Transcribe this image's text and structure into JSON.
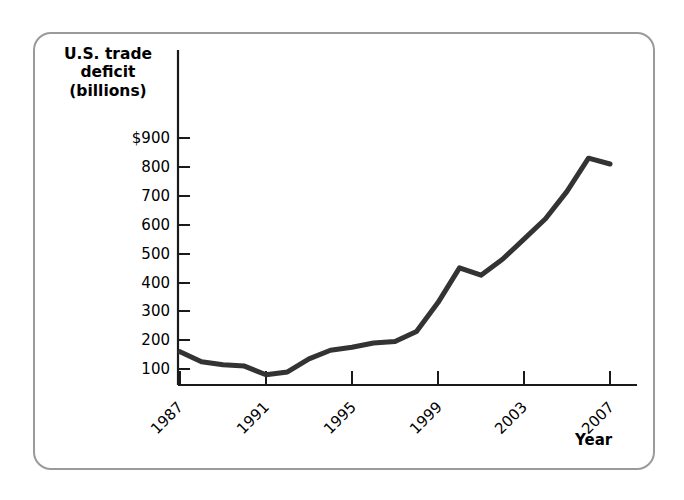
{
  "figure": {
    "frame_color": "#9a9a9a",
    "background": "#ffffff"
  },
  "axes": {
    "y_title_line1": "U.S. trade",
    "y_title_line2": "deficit",
    "y_title_line3": "(billions)",
    "x_title": "Year",
    "axis_color": "#1a1a1a"
  },
  "chart_data": {
    "type": "line",
    "title": "",
    "subtitle": "",
    "xlabel": "Year",
    "ylabel": "U.S. trade deficit (billions)",
    "line_color": "#333333",
    "line_width": 5,
    "grid": false,
    "legend": "none",
    "xlim": [
      1986,
      2008
    ],
    "ylim": [
      0,
      950
    ],
    "x_tick_labels": [
      "1987",
      "1991",
      "1995",
      "1999",
      "2003",
      "2007"
    ],
    "x_ticks": [
      1987,
      1991,
      1995,
      1999,
      2003,
      2007
    ],
    "y_tick_labels": [
      "$900",
      "800",
      "700",
      "600",
      "500",
      "400",
      "300",
      "200",
      "100"
    ],
    "y_ticks": [
      900,
      800,
      700,
      600,
      500,
      400,
      300,
      200,
      100
    ],
    "x": [
      1987,
      1988,
      1989,
      1990,
      1991,
      1992,
      1993,
      1994,
      1995,
      1996,
      1997,
      1998,
      1999,
      2000,
      2001,
      2002,
      2003,
      2004,
      2005,
      2006,
      2007
    ],
    "values": [
      160,
      125,
      115,
      110,
      80,
      90,
      135,
      165,
      175,
      190,
      195,
      230,
      330,
      450,
      425,
      480,
      550,
      620,
      715,
      830,
      810
    ],
    "series": [
      {
        "name": "U.S. trade deficit",
        "values": [
          160,
          125,
          115,
          110,
          80,
          90,
          135,
          165,
          175,
          190,
          195,
          230,
          330,
          450,
          425,
          480,
          550,
          620,
          715,
          830,
          810
        ]
      }
    ],
    "annotations": []
  }
}
